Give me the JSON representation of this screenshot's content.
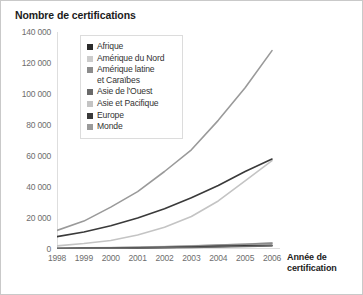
{
  "chart_data": {
    "type": "line",
    "title": "Nombre de certifications",
    "xlabel": "Année de certification",
    "ylabel": "Nombre de certifications",
    "x": [
      1998,
      1999,
      2000,
      2001,
      2002,
      2003,
      2004,
      2005,
      2006
    ],
    "categories": [
      "1998",
      "1999",
      "2000",
      "2001",
      "2002",
      "2003",
      "2004",
      "2005",
      "2006"
    ],
    "ylim": [
      0,
      140000
    ],
    "yticks": [
      0,
      20000,
      40000,
      60000,
      80000,
      100000,
      120000,
      140000
    ],
    "ytick_labels": [
      "0",
      "20 000",
      "40 000",
      "60 000",
      "80 000",
      "100 000",
      "120 000",
      "140 000"
    ],
    "grid": false,
    "legend_position": "upper-left-inside",
    "series": [
      {
        "name": "Afrique",
        "color": "#2b2b2b",
        "values": [
          300,
          400,
          500,
          700,
          1000,
          1300,
          1700,
          2000,
          2400
        ]
      },
      {
        "name": "Amérique du Nord",
        "color": "#cccccc",
        "values": [
          500,
          700,
          900,
          1200,
          1600,
          2000,
          2600,
          3200,
          3900
        ]
      },
      {
        "name": "Amérique latine\net Caraïbes",
        "color": "#8c8c8c",
        "values": [
          400,
          600,
          800,
          1100,
          1500,
          1900,
          2500,
          3100,
          3800
        ]
      },
      {
        "name": "Asie de l'Ouest",
        "color": "#6a6a6a",
        "values": [
          200,
          300,
          400,
          600,
          800,
          1000,
          1300,
          1600,
          2000
        ]
      },
      {
        "name": "Asie et Pacifique",
        "color": "#c4c4c4",
        "values": [
          2000,
          3500,
          5500,
          9000,
          14000,
          21000,
          31000,
          44000,
          57000
        ]
      },
      {
        "name": "Europe",
        "color": "#3a3a3a",
        "values": [
          8000,
          11000,
          15000,
          20000,
          26000,
          33000,
          41000,
          50000,
          58000
        ]
      },
      {
        "name": "Monde",
        "color": "#9a9a9a",
        "values": [
          12000,
          18000,
          27000,
          37000,
          50000,
          64000,
          83000,
          104000,
          128000
        ]
      }
    ]
  },
  "legend": {
    "items": [
      {
        "label": "Afrique",
        "color": "#2b2b2b"
      },
      {
        "label": "Amérique du Nord",
        "color": "#cccccc"
      },
      {
        "label": "Amérique latine\net Caraïbes",
        "color": "#8c8c8c"
      },
      {
        "label": "Asie de l'Ouest",
        "color": "#6a6a6a"
      },
      {
        "label": "Asie et Pacifique",
        "color": "#c4c4c4"
      },
      {
        "label": "Europe",
        "color": "#3a3a3a"
      },
      {
        "label": "Monde",
        "color": "#9a9a9a"
      }
    ]
  },
  "axis_title": {
    "x": "Année de\ncertification"
  }
}
